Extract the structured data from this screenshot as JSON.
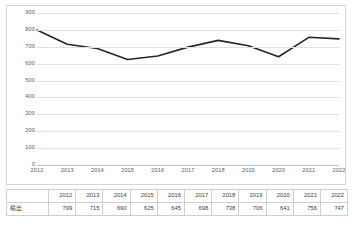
{
  "chart_data": {
    "type": "line",
    "title": "",
    "xlabel": "",
    "ylabel": "",
    "categories": [
      "2012",
      "2013",
      "2014",
      "2015",
      "2016",
      "2017",
      "2018",
      "2019",
      "2020",
      "2021",
      "2022"
    ],
    "series": [
      {
        "name": "輸出",
        "values": [
          799,
          715,
          690,
          625,
          645,
          698,
          738,
          706,
          641,
          756,
          747
        ],
        "color": "#262626"
      }
    ],
    "ylim": [
      0,
      900
    ],
    "ytick_step": 100,
    "yticks": [
      "0",
      "100",
      "200",
      "300",
      "400",
      "500",
      "600",
      "700",
      "800",
      "900"
    ],
    "grid": true,
    "legend": "none"
  },
  "table": {
    "corner_label": "",
    "column_headers": [
      "2012",
      "2013",
      "2014",
      "2015",
      "2016",
      "2017",
      "2018",
      "2019",
      "2020",
      "2021",
      "2022"
    ],
    "rows": [
      {
        "label": "輸出",
        "values": [
          "799",
          "715",
          "690",
          "625",
          "645",
          "698",
          "738",
          "706",
          "641",
          "756",
          "747"
        ]
      }
    ]
  }
}
